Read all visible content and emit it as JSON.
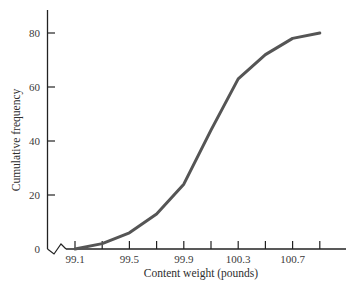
{
  "chart_data": {
    "type": "line",
    "title": "",
    "xlabel": "Content weight (pounds)",
    "ylabel": "Cumulative frequency",
    "x": [
      99.1,
      99.3,
      99.5,
      99.7,
      99.9,
      100.1,
      100.3,
      100.5,
      100.7,
      100.9
    ],
    "series": [
      {
        "name": "Cumulative frequency",
        "values": [
          0,
          2,
          6,
          13,
          24,
          44,
          63,
          72,
          78,
          80
        ]
      }
    ],
    "x_tick_labels": [
      "99.1",
      "99.5",
      "99.9",
      "100.3",
      "100.7"
    ],
    "x_tick_positions": [
      99.1,
      99.3,
      99.5,
      99.7,
      99.9,
      100.1,
      100.3,
      100.5,
      100.7,
      100.9
    ],
    "y_tick_labels": [
      "0",
      "20",
      "40",
      "60",
      "80"
    ],
    "y_ticks": [
      0,
      20,
      40,
      60,
      80
    ],
    "xlim": [
      98.85,
      101.1
    ],
    "ylim": [
      0,
      88
    ],
    "grid": false,
    "legend": "none",
    "axis_break": "x-axis broken near origin (zigzag)",
    "colors": {
      "line": "#555555",
      "axis": "#222222"
    }
  }
}
